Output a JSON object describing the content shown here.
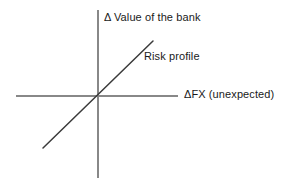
{
  "figure": {
    "type": "line-diagram",
    "background_color": "#ffffff",
    "line_color": "#3a3a3a",
    "axis_color": "#888888",
    "text_color": "#1a1a1a"
  },
  "labels": {
    "y_axis": "Δ Value of the bank",
    "x_axis": "ΔFX (unexpected)",
    "risk_profile": "Risk profile"
  },
  "chart_data": {
    "type": "line",
    "title": "",
    "xlabel": "ΔFX (unexpected)",
    "ylabel": "Δ Value of the bank",
    "annotations": [
      "Risk profile"
    ],
    "grid": false,
    "legend": "none",
    "axes": {
      "origin": [
        98,
        96
      ],
      "x_axis_extent": [
        16,
        178
      ],
      "y_axis_extent": [
        10,
        178
      ],
      "x_zero_at_origin": true,
      "y_zero_at_origin": true
    },
    "series": [
      {
        "name": "Risk profile",
        "x": [
          -1,
          0,
          1
        ],
        "y": [
          -1,
          0,
          1
        ],
        "slope": 1,
        "intercept": 0,
        "pixel_endpoints": [
          [
            43,
            148
          ],
          [
            153,
            41
          ]
        ]
      }
    ],
    "xlim": [
      -1,
      1
    ],
    "ylim": [
      -1,
      1
    ]
  }
}
